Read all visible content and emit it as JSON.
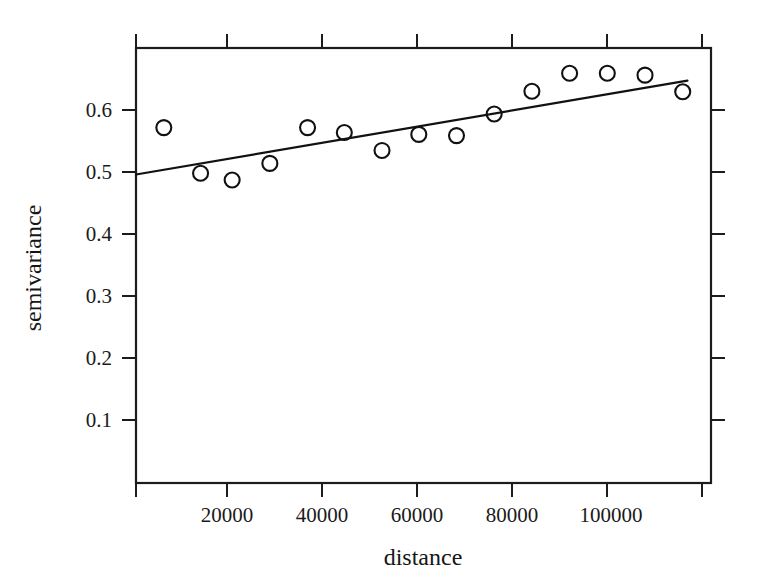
{
  "chart_data": {
    "type": "scatter",
    "title": "",
    "xlabel": "distance",
    "ylabel": "semivariance",
    "xlim": [
      0,
      122000
    ],
    "ylim": [
      0.0,
      0.705
    ],
    "grid": false,
    "legend": "none",
    "xticks": [
      20000,
      40000,
      60000,
      80000,
      100000
    ],
    "xticklabels": [
      "20000",
      "40000",
      "60000",
      "80000",
      "100000"
    ],
    "yticks": [
      0.1,
      0.2,
      0.3,
      0.4,
      0.5,
      0.6
    ],
    "yticklabels": [
      "0.1",
      "0.2",
      "0.3",
      "0.4",
      "0.5",
      "0.6"
    ],
    "marker": "open-circle",
    "x": [
      5900,
      13700,
      20400,
      28400,
      36400,
      44200,
      52200,
      60000,
      68000,
      76000,
      84000,
      92000,
      100000,
      108000,
      116000
    ],
    "y": [
      0.576,
      0.502,
      0.491,
      0.518,
      0.576,
      0.568,
      0.539,
      0.565,
      0.563,
      0.598,
      0.635,
      0.664,
      0.664,
      0.661,
      0.634
    ],
    "series": [
      {
        "name": "empirical semivariance",
        "type": "scatter",
        "x": [
          5900,
          13700,
          20400,
          28400,
          36400,
          44200,
          52200,
          60000,
          68000,
          76000,
          84000,
          92000,
          100000,
          108000,
          116000
        ],
        "values": [
          0.576,
          0.502,
          0.491,
          0.518,
          0.576,
          0.568,
          0.539,
          0.565,
          0.563,
          0.598,
          0.635,
          0.664,
          0.664,
          0.661,
          0.634
        ]
      },
      {
        "name": "fitted model",
        "type": "line",
        "x": [
          0,
          117000
        ],
        "values": [
          0.5,
          0.652
        ]
      }
    ],
    "fit_line": {
      "intercept": 0.5,
      "slope_per_unit": 1.3e-06,
      "x_start": 0,
      "x_end": 117000,
      "y_start": 0.5,
      "y_end": 0.652
    }
  },
  "axes": {
    "x_title": "distance",
    "y_title": "semivariance"
  }
}
